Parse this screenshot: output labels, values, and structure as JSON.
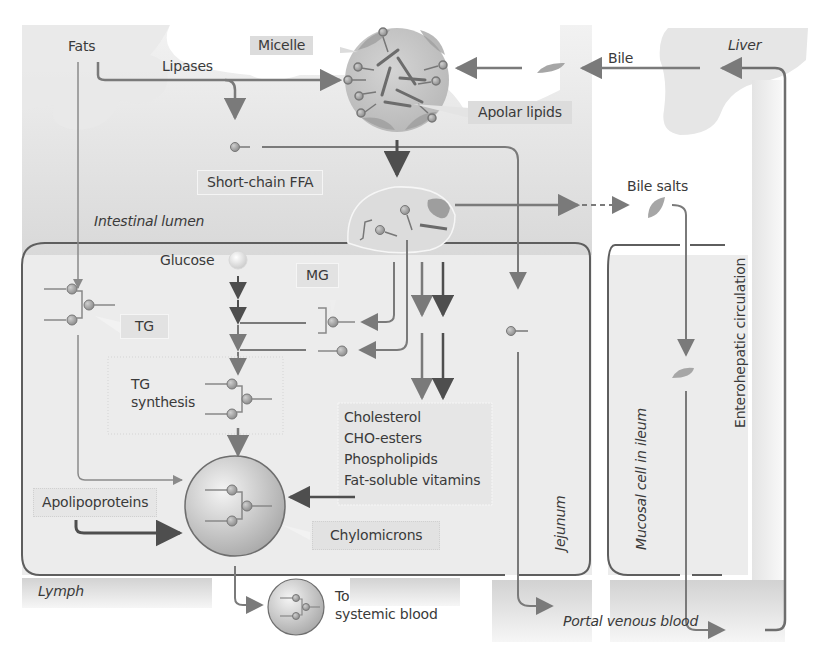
{
  "diagram": {
    "type": "flow-diagram",
    "colors": {
      "line": "#7a7a7a",
      "dark_line": "#555555",
      "region_fill": "#ececec",
      "lumen_fill": "#e0e0e0",
      "label_box": "#dcdcdc",
      "molecule": "#a8a8a8"
    },
    "labels": {
      "fats": "Fats",
      "lipases": "Lipases",
      "micelle": "Micelle",
      "apolar_lipids": "Apolar lipids",
      "bile": "Bile",
      "liver": "Liver",
      "short_chain_ffa": "Short-chain FFA",
      "intestinal_lumen": "Intestinal lumen",
      "bile_salts": "Bile salts",
      "glucose": "Glucose",
      "mg": "MG",
      "tg": "TG",
      "tg_synthesis_1": "TG",
      "tg_synthesis_2": "synthesis",
      "lipids": [
        "Cholesterol",
        "CHO-esters",
        "Phospholipids",
        "Fat-soluble vitamins"
      ],
      "apolipoproteins": "Apolipoproteins",
      "chylomicrons": "Chylomicrons",
      "lymph": "Lymph",
      "to_systemic_1": "To",
      "to_systemic_2": "systemic blood",
      "jejunum": "Jejunum",
      "mucosal_cell_ileum": "Mucosal cell in ileum",
      "enterohepatic": "Enterohepatic circulation",
      "portal_venous_blood": "Portal venous blood"
    },
    "nodes": [
      {
        "id": "fats",
        "label": "Fats"
      },
      {
        "id": "micelle",
        "label": "Micelle"
      },
      {
        "id": "liver",
        "label": "Liver"
      },
      {
        "id": "short_chain_ffa",
        "label": "Short-chain FFA"
      },
      {
        "id": "mixed_micelle_at_brush_border",
        "label": ""
      },
      {
        "id": "glucose",
        "label": "Glucose"
      },
      {
        "id": "mg",
        "label": "MG"
      },
      {
        "id": "tg",
        "label": "TG"
      },
      {
        "id": "tg_synthesis",
        "label": "TG synthesis"
      },
      {
        "id": "chylomicrons",
        "label": "Chylomicrons"
      },
      {
        "id": "lymph",
        "label": "Lymph"
      },
      {
        "id": "systemic_blood",
        "label": "To systemic blood"
      },
      {
        "id": "portal_venous_blood",
        "label": "Portal venous blood"
      },
      {
        "id": "bile_salts",
        "label": "Bile salts"
      }
    ],
    "edges": [
      {
        "from": "fats",
        "to": "micelle",
        "label": "Lipases"
      },
      {
        "from": "fats",
        "to": "short_chain_ffa",
        "label": "Lipases"
      },
      {
        "from": "fats",
        "to": "tg"
      },
      {
        "from": "liver",
        "to": "micelle",
        "label": "Bile"
      },
      {
        "from": "micelle",
        "to": "mixed_micelle_at_brush_border"
      },
      {
        "from": "short_chain_ffa",
        "to": "portal_venous_blood",
        "via": "Jejunum"
      },
      {
        "from": "mixed_micelle_at_brush_border",
        "to": "bile_salts"
      },
      {
        "from": "mixed_micelle_at_brush_border",
        "to": "mg"
      },
      {
        "from": "glucose",
        "to": "tg_synthesis"
      },
      {
        "from": "tg_synthesis",
        "to": "chylomicrons"
      },
      {
        "from": "tg",
        "to": "chylomicrons"
      },
      {
        "from": "mixed_micelle_at_brush_border",
        "to": "lipids_box"
      },
      {
        "from": "lipids_box",
        "to": "chylomicrons"
      },
      {
        "from": "apolipoproteins",
        "to": "chylomicrons"
      },
      {
        "from": "chylomicrons",
        "to": "systemic_blood",
        "via": "Lymph"
      },
      {
        "from": "bile_salts",
        "to": "portal_venous_blood",
        "via": "Mucosal cell in ileum"
      },
      {
        "from": "portal_venous_blood",
        "to": "liver",
        "label": "Enterohepatic circulation"
      }
    ]
  }
}
